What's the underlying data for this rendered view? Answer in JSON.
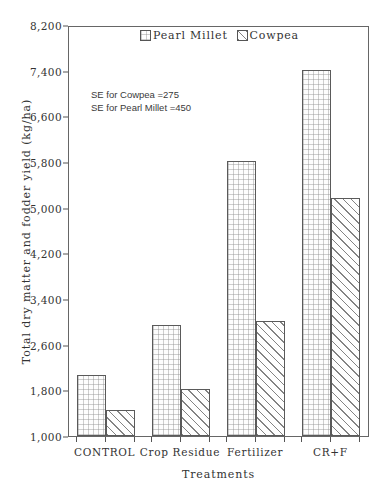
{
  "chart_data": {
    "type": "bar",
    "title": "",
    "subtitle": "",
    "xlabel": "Treatments",
    "ylabel": "Total dry matter and fodder yield (kg/ha)",
    "categories": [
      "CONTROL",
      "Crop Residue",
      "Fertilizer",
      "CR+F"
    ],
    "series": [
      {
        "name": "Pearl Millet",
        "values": [
          2050,
          2930,
          5800,
          7400
        ],
        "pattern": "cross-hatch"
      },
      {
        "name": "Cowpea",
        "values": [
          1430,
          1800,
          3000,
          5150
        ],
        "pattern": "diagonal-hatch"
      }
    ],
    "ylim": [
      1000,
      8200
    ],
    "yticks": [
      1000,
      1800,
      2600,
      3400,
      4200,
      5000,
      5800,
      6600,
      7400,
      8200
    ],
    "ytick_labels": [
      "1,000",
      "1,800",
      "2,600",
      "3,400",
      "4,200",
      "5,000",
      "5,800",
      "6,600",
      "7,400",
      "8,200"
    ],
    "grid": false,
    "legend_position": "top-center",
    "annotations": [
      "SE for Cowpea =275",
      "SE for Pearl Millet =450"
    ]
  },
  "legend": {
    "entries": [
      {
        "label": "Pearl Millet",
        "swatch": "cross-hatch-swatch"
      },
      {
        "label": "Cowpea",
        "swatch": "diagonal-hatch-swatch"
      }
    ]
  },
  "colors": {
    "axis": "#666666",
    "text": "#333333",
    "bar_outline": "#5a5a5a",
    "background": "#ffffff"
  }
}
